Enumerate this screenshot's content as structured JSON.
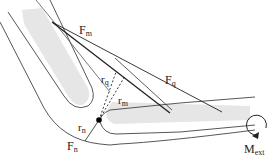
{
  "diagram": {
    "labels": {
      "fm": "F",
      "fm_sub": "m",
      "fq": "F",
      "fq_sub": "q",
      "fn": "F",
      "fn_sub": "n",
      "rq": "r",
      "rq_sub": "q",
      "rm": "r",
      "rm_sub": "m",
      "rn": "r",
      "rn_sub": "n",
      "mext": "M",
      "mext_sub": "ext"
    },
    "colors": {
      "outline": "#333333",
      "bone_fill": "#e8e8e8",
      "line": "#222222"
    }
  }
}
